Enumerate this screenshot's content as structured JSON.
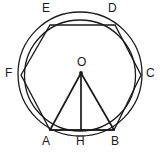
{
  "figure": {
    "canvas": {
      "width": 162,
      "height": 156
    },
    "stroke_color": "#1a1a1a",
    "background_color": "#ffffff",
    "center": {
      "name": "O",
      "x": 81,
      "y": 73
    },
    "circles": [
      {
        "name": "circumscribed-circle",
        "cx": 80,
        "cy": 74,
        "r": 62,
        "stroke_width": 1.3
      },
      {
        "name": "inner-circle",
        "cx": 80,
        "cy": 75,
        "r": 56,
        "stroke_width": 1.3
      }
    ],
    "hexagon": {
      "name": "hexagon-ABCDEF",
      "stroke_width": 1.3,
      "vertices": [
        {
          "label": "A",
          "x": 50,
          "y": 130,
          "label_x": 42,
          "label_y": 134
        },
        {
          "label": "B",
          "x": 114,
          "y": 130,
          "label_x": 113,
          "label_y": 134
        },
        {
          "label": "C",
          "x": 141,
          "y": 75,
          "label_x": 146,
          "label_y": 68
        },
        {
          "label": "D",
          "x": 115,
          "y": 25,
          "label_x": 110,
          "label_y": 2
        },
        {
          "label": "E",
          "x": 50,
          "y": 25,
          "label_x": 42,
          "label_y": 2
        },
        {
          "label": "F",
          "x": 21,
          "y": 75,
          "label_x": 8,
          "label_y": 68
        }
      ]
    },
    "triangle": {
      "name": "triangle-OAB",
      "stroke_width": 1.6,
      "apex": {
        "label": "O",
        "x": 81,
        "y": 73
      },
      "base_left": {
        "label": "A",
        "x": 50,
        "y": 130
      },
      "base_right": {
        "label": "B",
        "x": 114,
        "y": 130
      }
    },
    "apothem": {
      "name": "apothem-OH",
      "from": {
        "label": "O",
        "x": 81,
        "y": 73
      },
      "to": {
        "label": "H",
        "x": 81,
        "y": 130
      },
      "stroke_width": 1.6
    },
    "labels": [
      {
        "key": "O",
        "text": "O",
        "x": 77,
        "y": 58
      },
      {
        "key": "A",
        "text": "A",
        "x": 42,
        "y": 136
      },
      {
        "key": "H",
        "text": "H",
        "x": 76,
        "y": 136
      },
      {
        "key": "B",
        "text": "B",
        "x": 111,
        "y": 136
      },
      {
        "key": "C",
        "text": "C",
        "x": 146,
        "y": 68
      },
      {
        "key": "D",
        "text": "D",
        "x": 108,
        "y": 2
      },
      {
        "key": "E",
        "text": "E",
        "x": 42,
        "y": 2
      },
      {
        "key": "F",
        "text": "F",
        "x": 6,
        "y": 68
      }
    ]
  }
}
